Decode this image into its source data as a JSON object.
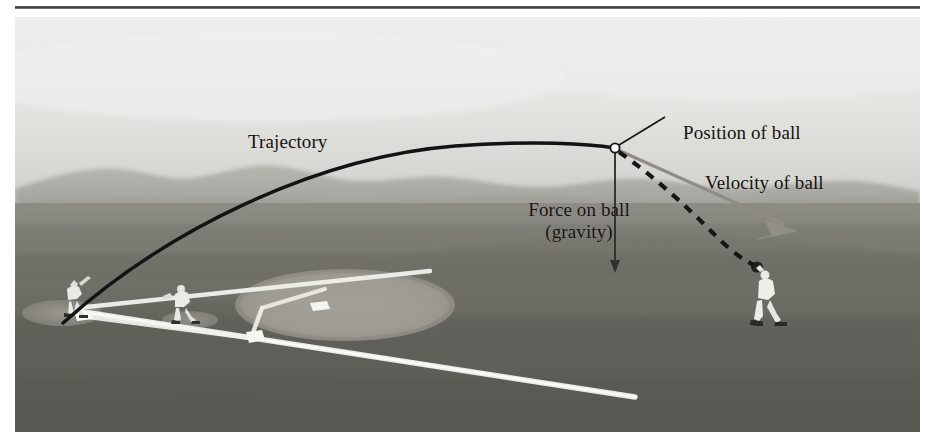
{
  "figure": {
    "scene": "baseball field with batter at home plate, infielder, and outfielder catching a fly ball",
    "width": 947,
    "height": 448
  },
  "annotations": {
    "trajectory": "Trajectory",
    "position_of_ball": "Position of ball",
    "velocity_of_ball": "Velocity of ball",
    "force_on_ball_line1": "Force on ball",
    "force_on_ball_line2": "(gravity)"
  },
  "colors": {
    "sky_top": "#e7e7e5",
    "sky_bottom": "#d2d2cf",
    "hills": "#a8a8a4",
    "grass_far": "#8f8f88",
    "grass_near": "#5f5f59",
    "infield_dirt": "#9a9791",
    "chalk_line": "#f2f2ee",
    "trajectory_curve": "#101010",
    "velocity_arrow": "#8e8b83",
    "gravity_arrow": "#2b2b28",
    "ball_marker": "#ffffff",
    "text": "#15100c",
    "rule": "#3c3c3c"
  },
  "graphics": {
    "trajectory_label_text": "Trajectory",
    "ball_marker_name": "ball-position-marker",
    "curve_style": "solid arc from home plate to apex then to ball position",
    "dashed_style": "dashed continuation of trajectory to the fielder's glove",
    "velocity_arrow_direction": "down-right, tangent to trajectory",
    "gravity_arrow_direction": "straight down from the ball"
  }
}
